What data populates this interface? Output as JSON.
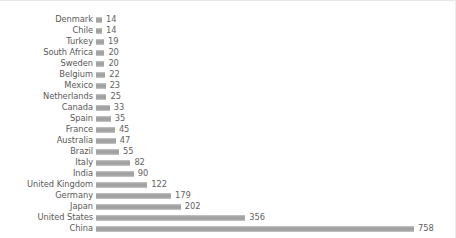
{
  "chart_data": {
    "type": "bar",
    "orientation": "horizontal",
    "title": "",
    "subtitle": "",
    "xlabel": "",
    "ylabel": "",
    "grid": false,
    "legend": null,
    "legend_position": "none",
    "axis_visible": false,
    "tick_labels_visible": false,
    "data_labels_visible": true,
    "xlim": [
      0,
      758
    ],
    "bar_color": "#a0a0a0",
    "label_color": "#595959",
    "value_color": "#636363",
    "background": "#ffffff",
    "categories": [
      "Denmark",
      "Chile",
      "Turkey",
      "South Africa",
      "Sweden",
      "Belgium",
      "Mexico",
      "Netherlands",
      "Canada",
      "Spain",
      "France",
      "Australia",
      "Brazil",
      "Italy",
      "India",
      "United Kingdom",
      "Germany",
      "Japan",
      "United States",
      "China"
    ],
    "values": [
      14,
      14,
      19,
      20,
      20,
      22,
      23,
      25,
      33,
      35,
      45,
      47,
      55,
      82,
      90,
      122,
      179,
      202,
      356,
      758
    ]
  }
}
